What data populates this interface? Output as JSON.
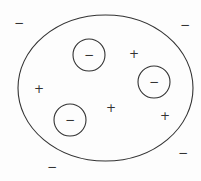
{
  "diagram": {
    "stroke_color": "#333333",
    "background": "#ffffff",
    "outer_boundary": {
      "shape": "ellipse",
      "cx": 105.5,
      "cy": 88,
      "rx": 87.5,
      "ry": 73
    },
    "inner_circles": [
      {
        "cx": 89,
        "cy": 55,
        "r": 16,
        "label": "−"
      },
      {
        "cx": 154,
        "cy": 82,
        "r": 16,
        "label": "−"
      },
      {
        "cx": 70,
        "cy": 120,
        "r": 16,
        "label": "−"
      }
    ],
    "inside_charges": [
      {
        "x": 134,
        "y": 54,
        "label": "+"
      },
      {
        "x": 39,
        "y": 89,
        "label": "+"
      },
      {
        "x": 111,
        "y": 108,
        "label": "+"
      },
      {
        "x": 165,
        "y": 116,
        "label": "+"
      }
    ],
    "outside_charges": [
      {
        "x": 19,
        "y": 23,
        "label": "−"
      },
      {
        "x": 185,
        "y": 25,
        "label": "−"
      },
      {
        "x": 183,
        "y": 153,
        "label": "−"
      },
      {
        "x": 52,
        "y": 167,
        "label": "−"
      }
    ]
  }
}
